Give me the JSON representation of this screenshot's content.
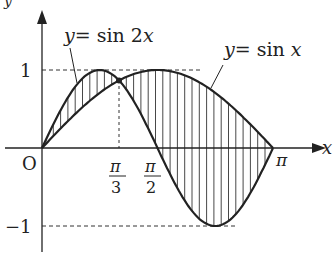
{
  "diagram": {
    "axes": {
      "x_label": "x",
      "y_label": "y",
      "origin_label": "O"
    },
    "curves": [
      {
        "label": "y = sin 2x",
        "func": "sin 2x"
      },
      {
        "label": "y = sin x",
        "func": "sin x"
      }
    ],
    "ticks": {
      "y_pos": "1",
      "y_neg": "−1",
      "x_pi3_num": "π",
      "x_pi3_den": "3",
      "x_pi2_num": "π",
      "x_pi2_den": "2",
      "x_pi": "π"
    },
    "shading": "vertical hatching between curves from 0 to π",
    "intersection": "x = π/3"
  },
  "labels": {
    "sin2x_y": "y",
    "sin2x_rest": "= sin 2",
    "sin2x_x": "x",
    "sinx_y": "y",
    "sinx_rest": "= sin ",
    "sinx_x": "x"
  }
}
